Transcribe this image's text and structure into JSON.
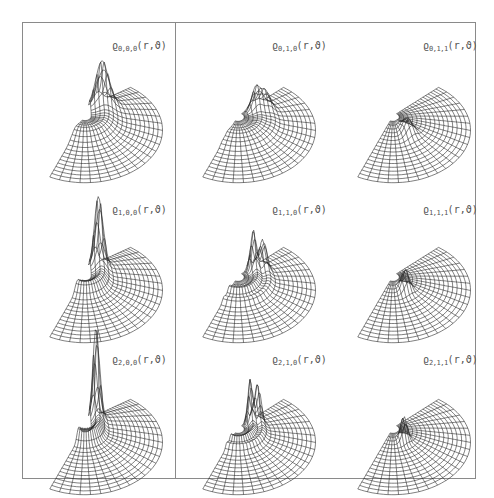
{
  "figure": {
    "line_color": "#2a2a2a",
    "frame_color": "#8a8a8a",
    "label_color": "#555555"
  },
  "panels": [
    {
      "id": "p000",
      "row": 0,
      "col": 0,
      "symbol": "ϱ",
      "indices": "0,0,0",
      "args": "(r,ϑ)",
      "label_x": 112,
      "label_y": 40,
      "ox": 30,
      "oy": 88,
      "peaks": [
        {
          "a": 0.0,
          "r": 0.28,
          "h": 38,
          "w": 0.14
        }
      ],
      "type": "l0"
    },
    {
      "id": "p010",
      "row": 0,
      "col": 1,
      "symbol": "ϱ",
      "indices": "0,1,0",
      "args": "(r,ϑ)",
      "label_x": 272,
      "label_y": 40,
      "ox": 183,
      "oy": 88,
      "peaks": [
        {
          "a": 0.0,
          "r": 0.3,
          "h": 22,
          "w": 0.1
        },
        {
          "a": 0.0,
          "r": 0.45,
          "h": 14,
          "w": 0.08
        }
      ],
      "type": "l1"
    },
    {
      "id": "p011",
      "row": 0,
      "col": 2,
      "symbol": "ϱ",
      "indices": "0,1,1",
      "args": "(r,ϑ)",
      "label_x": 423,
      "label_y": 40,
      "ox": 338,
      "oy": 88,
      "peaks": [
        {
          "a": 1.57,
          "r": 0.3,
          "h": 14,
          "w": 0.12
        }
      ],
      "type": "m1"
    },
    {
      "id": "p100",
      "row": 1,
      "col": 0,
      "symbol": "ϱ",
      "indices": "1,0,0",
      "args": "(r,ϑ)",
      "label_x": 112,
      "label_y": 204,
      "ox": 30,
      "oy": 248,
      "peaks": [
        {
          "a": 0.0,
          "r": 0.22,
          "h": 60,
          "w": 0.09
        }
      ],
      "type": "l0"
    },
    {
      "id": "p110",
      "row": 1,
      "col": 1,
      "symbol": "ϱ",
      "indices": "1,1,0",
      "args": "(r,ϑ)",
      "label_x": 272,
      "label_y": 204,
      "ox": 183,
      "oy": 248,
      "peaks": [
        {
          "a": 0.0,
          "r": 0.25,
          "h": 36,
          "w": 0.06
        },
        {
          "a": 0.0,
          "r": 0.4,
          "h": 26,
          "w": 0.06
        }
      ],
      "type": "l1"
    },
    {
      "id": "p111",
      "row": 1,
      "col": 2,
      "symbol": "ϱ",
      "indices": "1,1,1",
      "args": "(r,ϑ)",
      "label_x": 423,
      "label_y": 204,
      "ox": 338,
      "oy": 248,
      "peaks": [
        {
          "a": 1.57,
          "r": 0.25,
          "h": 20,
          "w": 0.08
        }
      ],
      "type": "m1"
    },
    {
      "id": "p200",
      "row": 2,
      "col": 0,
      "symbol": "ϱ",
      "indices": "2,0,0",
      "args": "(r,ϑ)",
      "label_x": 112,
      "label_y": 354,
      "ox": 30,
      "oy": 400,
      "peaks": [
        {
          "a": 0.0,
          "r": 0.18,
          "h": 78,
          "w": 0.07
        }
      ],
      "type": "l0"
    },
    {
      "id": "p210",
      "row": 2,
      "col": 1,
      "symbol": "ϱ",
      "indices": "2,1,0",
      "args": "(r,ϑ)",
      "label_x": 272,
      "label_y": 354,
      "ox": 183,
      "oy": 400,
      "peaks": [
        {
          "a": 0.0,
          "r": 0.2,
          "h": 40,
          "w": 0.05
        },
        {
          "a": 0.0,
          "r": 0.32,
          "h": 34,
          "w": 0.05
        }
      ],
      "type": "l1"
    },
    {
      "id": "p211",
      "row": 2,
      "col": 2,
      "symbol": "ϱ",
      "indices": "2,1,1",
      "args": "(r,ϑ)",
      "label_x": 423,
      "label_y": 354,
      "ox": 338,
      "oy": 400,
      "peaks": [
        {
          "a": 1.57,
          "r": 0.22,
          "h": 24,
          "w": 0.06
        }
      ],
      "type": "m1"
    }
  ]
}
